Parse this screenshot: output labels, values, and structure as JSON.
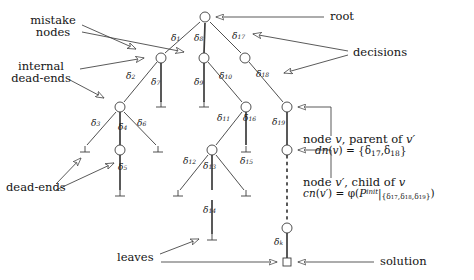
{
  "figure": {
    "type": "search-tree-diagram",
    "stroke_color": "#3c3c3c",
    "text_color": "#141414",
    "width": 474,
    "height": 280
  },
  "annotations": {
    "mistake_nodes": "mistake\nnodes",
    "mistake_nodes_line1": "mistake",
    "mistake_nodes_line2": "nodes",
    "internal_dead_ends_line1": "internal",
    "internal_dead_ends_line2": "dead-ends",
    "dead_ends": "dead-ends",
    "leaves": "leaves",
    "root": "root",
    "decisions": "decisions",
    "solution": "solution",
    "node_v_line1": "node v, parent of v′",
    "node_v_line2_prefix": "dn(v) = {",
    "node_v_line2_d1": "δ",
    "node_v_line2_d1_sub": "17",
    "node_v_line2_sep": ", ",
    "node_v_line2_d2": "δ",
    "node_v_line2_d2_sub": "18",
    "node_v_line2_suffix": "}",
    "node_vp_line1": "node v′, child of v",
    "node_vp_line2": "cn(v′) = φ(P",
    "node_vp_line2_sup": "init",
    "node_vp_line2_restrict": "|",
    "node_vp_line2_set": "{δ₁₇,δ₁₈,δ₁₉}",
    "node_vp_line2_close": ")"
  },
  "decision_labels": [
    {
      "id": "d1",
      "glyph": "δ",
      "sub": "1",
      "x": 176,
      "y": 41
    },
    {
      "id": "d2",
      "glyph": "δ",
      "sub": "2",
      "x": 131,
      "y": 79
    },
    {
      "id": "d3",
      "glyph": "δ",
      "sub": "3",
      "x": 96,
      "y": 126
    },
    {
      "id": "d4",
      "glyph": "δ",
      "sub": "4",
      "x": 123,
      "y": 126
    },
    {
      "id": "d5",
      "glyph": "δ",
      "sub": "5",
      "x": 123,
      "y": 168
    },
    {
      "id": "d6",
      "glyph": "δ",
      "sub": "6",
      "x": 142,
      "y": 126
    },
    {
      "id": "d7",
      "glyph": "δ",
      "sub": "7",
      "x": 164,
      "y": 83
    },
    {
      "id": "d8",
      "glyph": "δ",
      "sub": "8",
      "x": 207,
      "y": 41
    },
    {
      "id": "d9",
      "glyph": "δ",
      "sub": "9",
      "x": 207,
      "y": 83
    },
    {
      "id": "d10",
      "glyph": "δ",
      "sub": "10",
      "x": 226,
      "y": 78
    },
    {
      "id": "d11",
      "glyph": "δ",
      "sub": "11",
      "x": 226,
      "y": 121
    },
    {
      "id": "d12",
      "glyph": "δ",
      "sub": "12",
      "x": 190,
      "y": 162
    },
    {
      "id": "d13",
      "glyph": "δ",
      "sub": "13",
      "x": 211,
      "y": 166
    },
    {
      "id": "d14",
      "glyph": "δ",
      "sub": "14",
      "x": 211,
      "y": 211
    },
    {
      "id": "d15",
      "glyph": "δ",
      "sub": "15",
      "x": 246,
      "y": 162
    },
    {
      "id": "d16",
      "glyph": "δ",
      "sub": "16",
      "x": 250,
      "y": 121
    },
    {
      "id": "d17",
      "glyph": "δ",
      "sub": "17",
      "x": 240,
      "y": 38
    },
    {
      "id": "d18",
      "glyph": "δ",
      "sub": "18",
      "x": 264,
      "y": 76
    },
    {
      "id": "d19",
      "glyph": "δ",
      "sub": "19",
      "x": 290,
      "y": 123
    },
    {
      "id": "dk",
      "glyph": "δ",
      "sub": "k",
      "x": 290,
      "y": 243
    }
  ],
  "nodes": [
    {
      "id": "root",
      "kind": "circle",
      "x": 205,
      "y": 17
    },
    {
      "id": "n-a",
      "kind": "circle",
      "x": 161,
      "y": 58
    },
    {
      "id": "n-b",
      "kind": "circle",
      "x": 204,
      "y": 58
    },
    {
      "id": "n-c",
      "kind": "circle",
      "x": 245,
      "y": 58
    },
    {
      "id": "n-d",
      "kind": "circle",
      "x": 120,
      "y": 107
    },
    {
      "id": "n-e",
      "kind": "circle",
      "x": 246,
      "y": 107
    },
    {
      "id": "n-v",
      "kind": "circle",
      "x": 287,
      "y": 107
    },
    {
      "id": "n-f",
      "kind": "circle",
      "x": 120,
      "y": 150
    },
    {
      "id": "n-g",
      "kind": "circle",
      "x": 212,
      "y": 150
    },
    {
      "id": "n-vp",
      "kind": "circle",
      "x": 287,
      "y": 150
    },
    {
      "id": "n-k",
      "kind": "circle",
      "x": 287,
      "y": 228
    },
    {
      "id": "n-sol",
      "kind": "square",
      "x": 287,
      "y": 262
    }
  ],
  "dead_end_marks": [
    {
      "id": "de-1",
      "x": 161,
      "y": 105
    },
    {
      "id": "de-2",
      "x": 204,
      "y": 105
    },
    {
      "id": "de-3",
      "x": 85,
      "y": 150
    },
    {
      "id": "de-4",
      "x": 158,
      "y": 150
    },
    {
      "id": "de-5",
      "x": 120,
      "y": 194
    },
    {
      "id": "de-6",
      "x": 178,
      "y": 194
    },
    {
      "id": "de-7",
      "x": 246,
      "y": 194
    },
    {
      "id": "de-8",
      "x": 246,
      "y": 150
    },
    {
      "id": "de-9",
      "x": 212,
      "y": 238
    }
  ]
}
